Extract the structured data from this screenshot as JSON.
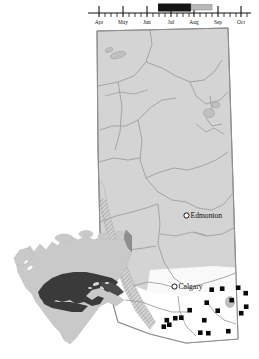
{
  "figure": {
    "background_color": "#ffffff"
  },
  "timeline": {
    "name": "sampling-season-timeline",
    "axis_color": "#111111",
    "months": [
      {
        "label": "Apr",
        "x": 99
      },
      {
        "label": "May",
        "x": 123
      },
      {
        "label": "Jun",
        "x": 147
      },
      {
        "label": "Jul",
        "x": 171
      },
      {
        "label": "Aug",
        "x": 194
      },
      {
        "label": "Sep",
        "x": 218
      },
      {
        "label": "Oct",
        "x": 241
      }
    ],
    "bars": [
      {
        "name": "primary-period-bar",
        "start_x": 158,
        "end_x": 191,
        "color": "#141414",
        "label": "primary period"
      },
      {
        "name": "secondary-period-bar",
        "start_x": 191,
        "end_x": 212,
        "color": "#b9b9b9",
        "label": "secondary period"
      }
    ],
    "axis_start_x": 88,
    "axis_end_x": 251,
    "axis_y": 13
  },
  "province": {
    "name": "Alberta",
    "fill_color": "#d4d4d4",
    "border_color": "#8c8c8c",
    "river_color": "#9a9a9a",
    "study_area_fill": "#ffffff",
    "mountain_band_color": "#a8a8a8"
  },
  "cities": [
    {
      "name": "Edmonton",
      "label": "Edmonton",
      "marker_x": 186.5,
      "marker_y": 215.5,
      "label_x": 191,
      "label_y": 218
    },
    {
      "name": "Calgary",
      "label": "Calgary",
      "marker_x": 174.5,
      "marker_y": 286.5,
      "label_x": 179,
      "label_y": 289
    }
  ],
  "sampling_sites": {
    "name": "sampling-site-markers",
    "color": "#0a0a0a",
    "count": 19,
    "points": [
      {
        "x": 212.0,
        "y": 290.0
      },
      {
        "x": 222.5,
        "y": 289.0
      },
      {
        "x": 238.5,
        "y": 288.0
      },
      {
        "x": 246.0,
        "y": 293.5
      },
      {
        "x": 232.0,
        "y": 300.5
      },
      {
        "x": 207.0,
        "y": 303.0
      },
      {
        "x": 246.5,
        "y": 307.0
      },
      {
        "x": 190.0,
        "y": 310.5
      },
      {
        "x": 218.0,
        "y": 311.0
      },
      {
        "x": 241.5,
        "y": 313.5
      },
      {
        "x": 175.5,
        "y": 318.5
      },
      {
        "x": 181.5,
        "y": 318.0
      },
      {
        "x": 204.5,
        "y": 320.5
      },
      {
        "x": 167.0,
        "y": 320.5
      },
      {
        "x": 169.5,
        "y": 325.0
      },
      {
        "x": 164.0,
        "y": 327.0
      },
      {
        "x": 200.5,
        "y": 333.0
      },
      {
        "x": 208.5,
        "y": 333.5
      },
      {
        "x": 228.5,
        "y": 331.5
      }
    ]
  },
  "inset": {
    "name": "north-america-inset",
    "land_color": "#c9c9c9",
    "highlight_color": "#3a3a3a",
    "outline_color": "#bdbdbd",
    "description": "North America with highlighted distribution band"
  }
}
